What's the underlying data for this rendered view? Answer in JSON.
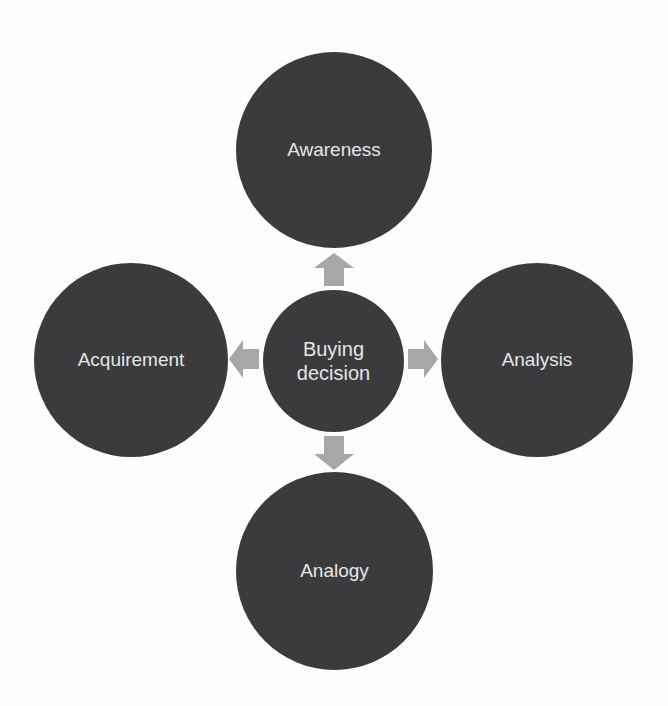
{
  "diagram": {
    "type": "radial-hub",
    "center": {
      "label": "Buying decision",
      "lines": [
        "Buying",
        "decision"
      ]
    },
    "nodes": [
      {
        "id": "top",
        "label": "Awareness",
        "direction": "up"
      },
      {
        "id": "right",
        "label": "Analysis",
        "direction": "right"
      },
      {
        "id": "bottom",
        "label": "Analogy",
        "direction": "down"
      },
      {
        "id": "left",
        "label": "Acquirement",
        "direction": "left"
      }
    ],
    "colors": {
      "circle_fill": "#3b3b3d",
      "circle_text": "#e6e6e6",
      "arrow_fill": "#a7a7a7",
      "background": "#fdfdfd"
    }
  }
}
